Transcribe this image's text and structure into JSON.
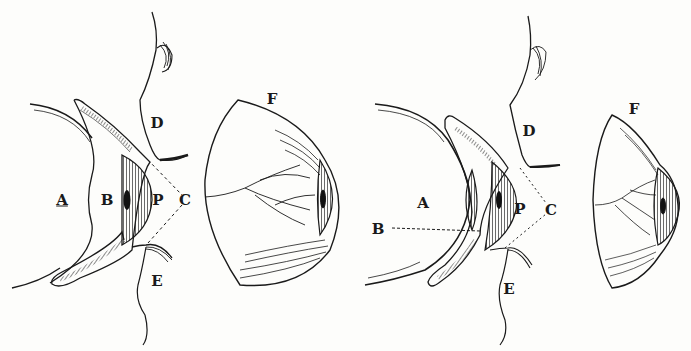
{
  "diagram": {
    "type": "anatomical-engraving",
    "ink_color": "#1a1a1a",
    "paper_color": "#fdfdfb",
    "figures": [
      {
        "id": "left",
        "labels": {
          "A": {
            "text": "A",
            "x": 62,
            "y": 200
          },
          "B": {
            "text": "B",
            "x": 107,
            "y": 200
          },
          "P": {
            "text": "P",
            "x": 158,
            "y": 200
          },
          "C": {
            "text": "C",
            "x": 185,
            "y": 200
          },
          "D": {
            "text": "D",
            "x": 157,
            "y": 123
          },
          "E": {
            "text": "E",
            "x": 157,
            "y": 281
          },
          "F": {
            "text": "F",
            "x": 272,
            "y": 99
          }
        }
      },
      {
        "id": "right",
        "labels": {
          "A": {
            "text": "A",
            "x": 423,
            "y": 203
          },
          "B": {
            "text": "B",
            "x": 378,
            "y": 229
          },
          "P": {
            "text": "P",
            "x": 520,
            "y": 209
          },
          "C": {
            "text": "C",
            "x": 551,
            "y": 210
          },
          "D": {
            "text": "D",
            "x": 529,
            "y": 131
          },
          "E": {
            "text": "E",
            "x": 509,
            "y": 289
          },
          "F": {
            "text": "F",
            "x": 634,
            "y": 109
          }
        }
      }
    ]
  }
}
